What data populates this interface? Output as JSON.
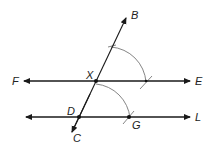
{
  "diagram": {
    "type": "geometric-construction",
    "colors": {
      "line": "#1a1a1a",
      "arc": "#777777",
      "point": "#111111",
      "label": "#222222"
    },
    "points": {
      "B": {
        "label": "B",
        "x": 127,
        "y": 17
      },
      "C": {
        "label": "C",
        "x": 71,
        "y": 134
      },
      "X": {
        "label": "X",
        "x": 96,
        "y": 81
      },
      "D": {
        "label": "D",
        "x": 79,
        "y": 117
      },
      "G": {
        "label": "G",
        "x": 129,
        "y": 117
      },
      "F": {
        "label": "F"
      },
      "E": {
        "label": "E"
      },
      "L": {
        "label": "L"
      }
    },
    "lines": [
      {
        "name": "transversal-BC",
        "from": "C",
        "to": "B"
      },
      {
        "name": "line-FE",
        "through": [
          "F",
          "X",
          "E"
        ]
      },
      {
        "name": "line-DL",
        "through": [
          "D",
          "G",
          "L"
        ]
      }
    ],
    "arcs": [
      {
        "name": "arc-centered-X",
        "center": "X"
      },
      {
        "name": "arc-centered-D",
        "center": "D",
        "through": "G"
      }
    ]
  }
}
